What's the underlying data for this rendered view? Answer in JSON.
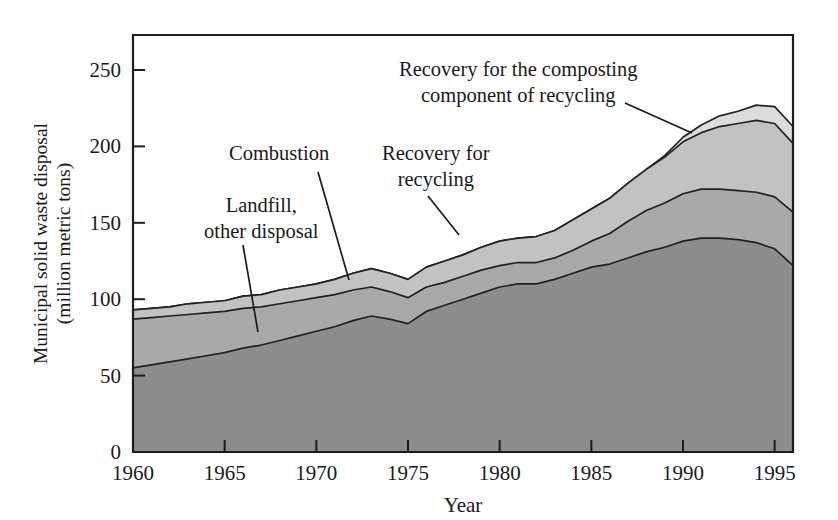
{
  "chart_data": {
    "type": "area",
    "title": "",
    "subtitle": "",
    "xlabel": "Year",
    "ylabel": "Municipal solid waste disposal (million metric tons)",
    "ylabel_line1": "Municipal solid waste disposal",
    "ylabel_line2": "(million metric tons)",
    "stacked": true,
    "grid": false,
    "legend_position": "none",
    "xlim": [
      1960,
      1996
    ],
    "ylim": [
      0,
      262
    ],
    "xticks": [
      1960,
      1965,
      1970,
      1975,
      1980,
      1985,
      1990,
      1995
    ],
    "xtick_labels": [
      "1960",
      "1965",
      "1970",
      "1975",
      "1980",
      "1985",
      "1990",
      "1995"
    ],
    "yticks": [
      0,
      50,
      100,
      150,
      200,
      250
    ],
    "ytick_labels": [
      "0",
      "50",
      "100",
      "150",
      "200",
      "250"
    ],
    "x": [
      1960,
      1961,
      1962,
      1963,
      1964,
      1965,
      1966,
      1967,
      1968,
      1969,
      1970,
      1971,
      1972,
      1973,
      1974,
      1975,
      1976,
      1977,
      1978,
      1979,
      1980,
      1981,
      1982,
      1983,
      1984,
      1985,
      1986,
      1987,
      1988,
      1989,
      1990,
      1991,
      1992,
      1993,
      1994,
      1995,
      1996
    ],
    "series": [
      {
        "name": "Landfill, other disposal",
        "color": "#8d8d8d",
        "values": [
          55,
          57,
          59,
          61,
          63,
          65,
          68,
          70,
          73,
          76,
          79,
          82,
          86,
          89,
          87,
          84,
          92,
          96,
          100,
          104,
          108,
          110,
          110,
          113,
          117,
          121,
          123,
          127,
          131,
          134,
          138,
          140,
          140,
          139,
          137,
          133,
          122
        ]
      },
      {
        "name": "Combustion",
        "color": "#a9a9a9",
        "values": [
          32,
          31,
          30,
          29,
          28,
          27,
          26,
          25,
          24,
          23,
          22,
          21,
          20,
          19,
          18,
          17,
          16,
          15,
          15,
          15,
          14,
          14,
          14,
          14,
          15,
          17,
          20,
          24,
          27,
          29,
          31,
          32,
          32,
          32,
          33,
          34,
          35
        ]
      },
      {
        "name": "Recovery for recycling",
        "color": "#c2c2c2",
        "values": [
          6,
          6,
          6,
          7,
          7,
          7,
          8,
          8,
          9,
          9,
          9,
          10,
          11,
          12,
          12,
          12,
          13,
          14,
          14,
          15,
          16,
          16,
          17,
          18,
          20,
          21,
          23,
          25,
          27,
          30,
          34,
          37,
          41,
          44,
          47,
          48,
          45
        ]
      },
      {
        "name": "Recovery for the composting component of recycling",
        "color": "#dcdcdc",
        "values": [
          0,
          0,
          0,
          0,
          0,
          0,
          0,
          0,
          0,
          0,
          0,
          0,
          0,
          0,
          0,
          0,
          0,
          0,
          0,
          0,
          0,
          0,
          0,
          0,
          0,
          0,
          0,
          0,
          0,
          1,
          3,
          5,
          7,
          8,
          10,
          11,
          11
        ]
      }
    ],
    "annotations": [
      {
        "id": "landfill",
        "label_lines": [
          "Landfill,",
          "other disposal"
        ],
        "text_x": 204,
        "text_y": 212,
        "leader": [
          [
            243,
            245
          ],
          [
            258,
            332
          ]
        ]
      },
      {
        "id": "combustion",
        "label_lines": [
          "Combustion"
        ],
        "text_x": 229,
        "text_y": 160,
        "leader": [
          [
            318,
            172
          ],
          [
            349,
            280
          ]
        ]
      },
      {
        "id": "recycling",
        "label_lines": [
          "Recovery for",
          "recycling"
        ],
        "text_x": 382,
        "text_y": 160,
        "leader": [
          [
            428,
            196
          ],
          [
            459,
            235
          ]
        ]
      },
      {
        "id": "composting",
        "label_lines": [
          "Recovery for the composting",
          "component of recycling"
        ],
        "text_x": 399,
        "text_y": 76,
        "leader": [
          [
            625,
            103
          ],
          [
            692,
            133
          ]
        ]
      }
    ]
  },
  "plot_geometry": {
    "left": 133,
    "right": 793,
    "top": 35,
    "bottom": 452
  }
}
